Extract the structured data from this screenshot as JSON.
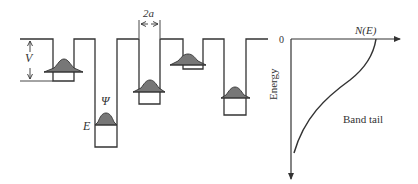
{
  "figure": {
    "type": "potential-wells-and-band-tail",
    "colors": {
      "line": "#333333",
      "wavepacket_fill": "#777777",
      "background": "#ffffff"
    }
  },
  "wells_panel": {
    "labels": {
      "V": "V",
      "psi": "Ψ",
      "E": "E",
      "width": "2a"
    },
    "wells": [
      {
        "index": 1,
        "depth": "shallow",
        "has_wavepacket": true
      },
      {
        "index": 2,
        "depth": "deepest",
        "has_wavepacket": true
      },
      {
        "index": 3,
        "depth": "deep",
        "has_wavepacket": true
      },
      {
        "index": 4,
        "depth": "shallowest",
        "has_wavepacket": true
      },
      {
        "index": 5,
        "depth": "medium",
        "has_wavepacket": true
      }
    ]
  },
  "dos_panel": {
    "origin_label": "0",
    "x_axis_label": "N(E)",
    "y_axis_label": "Energy",
    "curve_label": "Band tail"
  }
}
